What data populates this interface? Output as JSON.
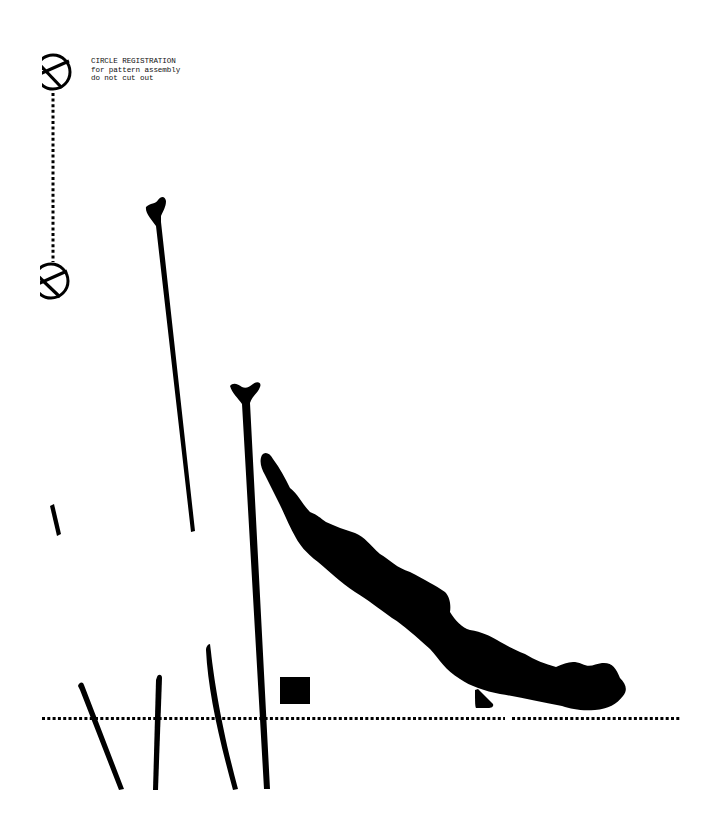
{
  "document": {
    "type": "sewing pattern sheet",
    "background": "#ffffff",
    "ink_color": "#000000"
  },
  "registration": {
    "note_lines": [
      "CIRCLE REGISTRATION",
      "for pattern assembly",
      "do not cut out"
    ],
    "marks": [
      {
        "name": "registration-circle-top",
        "cx": 53,
        "cy": 72,
        "r": 18
      },
      {
        "name": "registration-circle-bottom",
        "cx": 51,
        "cy": 281,
        "r": 18
      }
    ],
    "connector": {
      "style": "dotted",
      "x": 53,
      "y1": 92,
      "y2": 262
    }
  },
  "baseline": {
    "style": "dotted",
    "y": 718,
    "x1": 42,
    "x2": 681,
    "gap": [
      505,
      512
    ]
  },
  "pattern_pieces": {
    "tall_y_strokes": [
      {
        "name": "y-stroke-left",
        "top": [
          155,
          205
        ],
        "bottom": [
          193,
          530
        ]
      },
      {
        "name": "y-stroke-right",
        "top": [
          245,
          386
        ],
        "bottom": [
          267,
          788
        ]
      }
    ],
    "short_strokes": [
      {
        "name": "stroke-tick-left",
        "from": [
          52,
          505
        ],
        "to": [
          59,
          535
        ]
      },
      {
        "name": "stroke-1",
        "from": [
          80,
          684
        ],
        "to": [
          121,
          789
        ]
      },
      {
        "name": "stroke-2",
        "from": [
          159,
          677
        ],
        "to": [
          155,
          789
        ]
      },
      {
        "name": "stroke-3",
        "from": [
          207,
          645
        ],
        "to": [
          236,
          789
        ]
      }
    ],
    "blob": {
      "name": "leaf-shape",
      "from": [
        262,
        455
      ],
      "to": [
        627,
        711
      ]
    },
    "square": {
      "name": "notch-square",
      "x": 280,
      "y": 677,
      "w": 30,
      "h": 27
    },
    "triangle": {
      "name": "notch-triangle",
      "points": [
        [
          475,
          691
        ],
        [
          475,
          708
        ],
        [
          493,
          707
        ]
      ]
    }
  }
}
